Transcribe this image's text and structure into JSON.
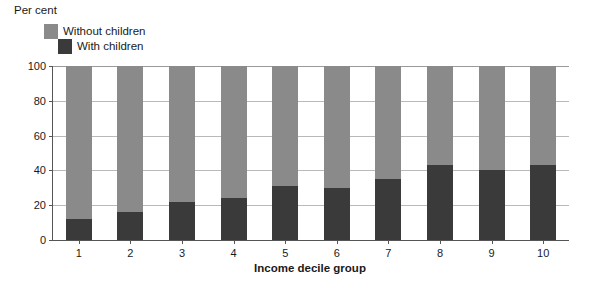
{
  "chart_data": {
    "type": "bar",
    "subtype": "stacked-percentage",
    "title": "",
    "ylabel": "Per cent",
    "xlabel": "Income decile group",
    "categories": [
      "1",
      "2",
      "3",
      "4",
      "5",
      "6",
      "7",
      "8",
      "9",
      "10"
    ],
    "series": [
      {
        "name": "With children",
        "color": "#3a3a3a",
        "values": [
          12,
          16,
          22,
          24,
          31,
          30,
          35,
          43,
          40,
          43
        ]
      },
      {
        "name": "Without children",
        "color": "#8a8a8a",
        "values": [
          88,
          84,
          78,
          76,
          69,
          70,
          65,
          57,
          60,
          57
        ]
      }
    ],
    "stack_order": [
      "With children",
      "Without children"
    ],
    "ylim": [
      0,
      100
    ],
    "yticks": [
      0,
      20,
      40,
      60,
      80,
      100
    ],
    "ytick_labels": [
      "0",
      "20",
      "40",
      "60",
      "80",
      "100"
    ],
    "grid": true,
    "grid_axis": "y",
    "legend_position": "top-left",
    "legend": [
      "Without children",
      "With children"
    ]
  },
  "axes": {
    "y_axis_caption": "Per cent",
    "x_axis_caption": "Income decile group"
  },
  "colors": {
    "without_children": "#8a8a8a",
    "with_children": "#3a3a3a",
    "grid": "#b9b9b9",
    "axis": "#555555",
    "background": "#ffffff",
    "text": "#1a1a1a"
  }
}
